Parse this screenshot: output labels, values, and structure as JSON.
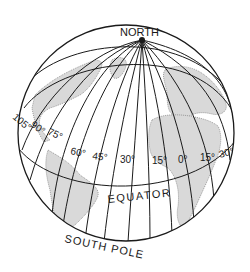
{
  "diagram": {
    "type": "globe-meridians",
    "labels": {
      "north_pole_line1": "NORTH",
      "north_pole_line2": "POLE",
      "equator": "EQUATOR",
      "south_pole": "SOUTH POLE"
    },
    "meridians": [
      {
        "label": "105°"
      },
      {
        "label": "90°"
      },
      {
        "label": "75°"
      },
      {
        "label": "60°"
      },
      {
        "label": "45°"
      },
      {
        "label": "30°"
      },
      {
        "label": "15°"
      },
      {
        "label": "0°"
      },
      {
        "label": "15°"
      },
      {
        "label": "30°"
      }
    ],
    "colors": {
      "ink": "#1a1a1a",
      "land": "#d9d9d9",
      "background": "#ffffff"
    }
  }
}
